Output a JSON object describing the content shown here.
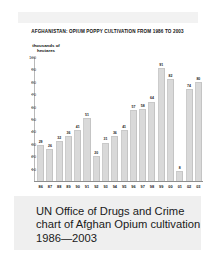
{
  "document": {
    "top_band": "",
    "chart_title": "AFGHANISTAN: OPIUM POPPY CULTIVATION FROM 1986 TO 2003"
  },
  "axis": {
    "y_caption_line1": "thousands of",
    "y_caption_line2": "hectares",
    "y_ticks": [
      "100",
      "90",
      "80",
      "70",
      "60",
      "50",
      "40",
      "30",
      "20",
      "10"
    ]
  },
  "caption": {
    "line1": "UN Office of Drugs and Crime",
    "line2": "chart of Afghan Opium cultivation",
    "line3": "1986—2003"
  },
  "colors": {
    "bar_fill": "#d9d9d9",
    "bar_edge": "#c6c6c6",
    "axis": "#9a9a9a",
    "caption_bg": "#efefef",
    "top_band": "#f2f2f2",
    "text": "#1a1a1a"
  },
  "chart_data": {
    "type": "bar",
    "title": "AFGHANISTAN: OPIUM POPPY CULTIVATION FROM 1986 TO 2003",
    "xlabel": "",
    "ylabel": "thousands of hectares",
    "ylim": [
      0,
      100
    ],
    "grid": false,
    "legend": "none",
    "categories": [
      "86",
      "87",
      "88",
      "89",
      "90",
      "91",
      "92",
      "93",
      "94",
      "95",
      "96",
      "97",
      "98",
      "99",
      "00",
      "01",
      "02",
      "03"
    ],
    "values": [
      29,
      26,
      32,
      36,
      41,
      51,
      20,
      31,
      36,
      41,
      57,
      58,
      64,
      91,
      82,
      8,
      74,
      80
    ],
    "value_labels": [
      "29",
      "26",
      "32",
      "36",
      "41",
      "51",
      "20",
      "31",
      "36",
      "41",
      "57",
      "58",
      "64",
      "91",
      "82",
      "8",
      "74",
      "80"
    ]
  }
}
